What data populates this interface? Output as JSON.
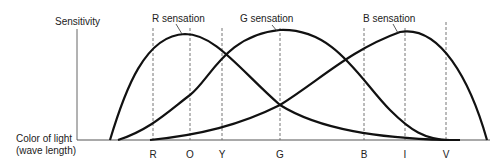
{
  "diagram": {
    "y_axis_label": "Sensitivity",
    "x_axis_label_line1": "Color of light",
    "x_axis_label_line2": "(wave length)",
    "curves": [
      {
        "name": "R sensation",
        "label": "R sensation",
        "peak_at": "O"
      },
      {
        "name": "G sensation",
        "label": "G sensation",
        "peak_at": "G"
      },
      {
        "name": "B sensation",
        "label": "B sensation",
        "peak_at": "I"
      }
    ],
    "ticks": [
      {
        "label": "R",
        "x": 153
      },
      {
        "label": "O",
        "x": 190
      },
      {
        "label": "Y",
        "x": 222
      },
      {
        "label": "G",
        "x": 280
      },
      {
        "label": "B",
        "x": 364
      },
      {
        "label": "I",
        "x": 405
      },
      {
        "label": "V",
        "x": 446
      }
    ],
    "colors": {
      "curve": "#111111",
      "axis": "#555555",
      "dashed": "#666666"
    }
  }
}
